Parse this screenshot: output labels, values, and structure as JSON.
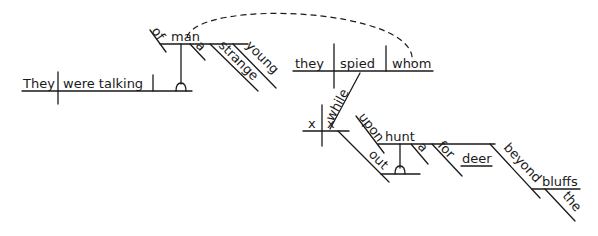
{
  "diagram": {
    "type": "sentence-diagram",
    "main_clause": {
      "subject": "They",
      "verb": "were talking",
      "object_phrase": {
        "head": "man",
        "preposition": "of",
        "modifiers": [
          "a",
          "strange",
          "young"
        ]
      }
    },
    "relative_clause": {
      "subject": "they",
      "verb": "spied",
      "object": "whom",
      "connector": "while",
      "sub_clause": {
        "subject": "x",
        "verb": "x",
        "adverb": "out",
        "preposition": "upon",
        "object": {
          "head": "hunt",
          "modifiers": [
            "a"
          ],
          "phrases": [
            {
              "preposition": "for",
              "object": "deer"
            },
            {
              "preposition": "beyond",
              "object": "bluffs",
              "modifier": "the"
            }
          ]
        }
      }
    },
    "colors": {
      "ink": "#1a1a1a",
      "background": "#ffffff"
    }
  }
}
